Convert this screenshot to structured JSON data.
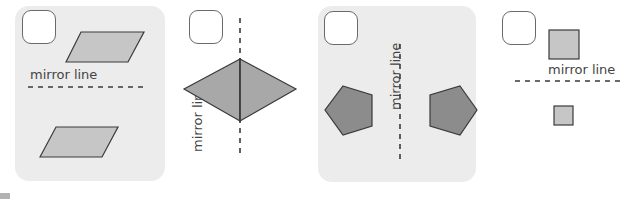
{
  "questions": [
    {
      "id": 1,
      "label": "mirror line",
      "shape": "parallelogram",
      "line_orientation": "horizontal",
      "checked": false
    },
    {
      "id": 2,
      "label": "mirror line",
      "shape": "kite",
      "line_orientation": "vertical",
      "checked": false
    },
    {
      "id": 3,
      "label": "mirror line",
      "shape": "pentagon",
      "line_orientation": "vertical",
      "checked": false
    },
    {
      "id": 4,
      "label": "mirror line",
      "shape": "square",
      "line_orientation": "horizontal",
      "checked": false
    }
  ],
  "colors": {
    "panel_bg": "#ececec",
    "shape_light": "#c6c6c6",
    "shape_dark": "#8c8c8c",
    "stroke": "#3a3a3a",
    "text": "#444444"
  }
}
